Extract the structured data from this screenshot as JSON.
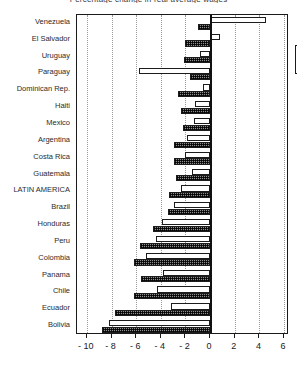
{
  "chart_data": {
    "type": "bar",
    "orientation": "horizontal",
    "title": "Percentage change in real average wages",
    "categories": [
      "Venezuela",
      "El Salvador",
      "Uruguay",
      "Paraguay",
      "Dominican Rep.",
      "Haiti",
      "Mexico",
      "Argentina",
      "Costa Rica",
      "Guatemala",
      "LATIN AMERICA",
      "Brazil",
      "Honduras",
      "Peru",
      "Colombia",
      "Panama",
      "Chile",
      "Ecuador",
      "Bolivia"
    ],
    "series": [
      {
        "name": "1997",
        "key": "y1997",
        "fill": "white",
        "values": [
          4.5,
          0.8,
          -0.8,
          -5.8,
          -0.6,
          -1.2,
          -1.3,
          -1.9,
          -2.0,
          -1.5,
          -2.4,
          -2.9,
          -3.9,
          -4.4,
          -5.2,
          -3.8,
          -4.3,
          -3.2,
          -8.2
        ]
      },
      {
        "name": "1998",
        "key": "y1998",
        "fill": "hatched",
        "values": [
          -1.0,
          -2.0,
          -2.1,
          -1.6,
          -2.6,
          -2.4,
          -2.2,
          -2.9,
          -2.9,
          -2.8,
          -3.3,
          -3.4,
          -4.6,
          -5.7,
          -6.2,
          -5.6,
          -6.2,
          -7.7,
          -8.8
        ]
      }
    ],
    "xlabel": "",
    "ylabel": "",
    "xlim": [
      -10.8,
      6.4
    ],
    "xticks": [
      -10,
      -8,
      -6,
      -4,
      -2,
      0,
      2,
      4,
      6
    ],
    "xticklabels": [
      "- 10",
      "- 8",
      "- 6",
      "- 4",
      "- 2",
      "0",
      "2",
      "4",
      "6"
    ],
    "gridlines": [
      -10,
      -8,
      -6,
      -4,
      -2,
      2,
      4,
      6
    ],
    "grid": true,
    "zero_axis": 0,
    "legend": {
      "position": "top-right-inside",
      "entries": [
        "1997",
        "1998"
      ]
    }
  }
}
